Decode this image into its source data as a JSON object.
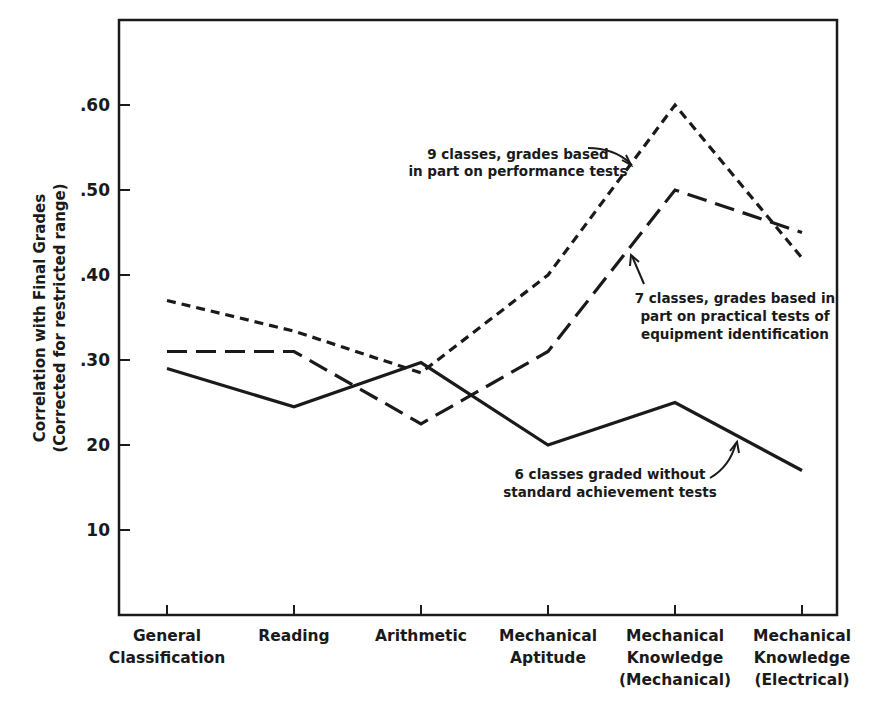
{
  "chart_data": {
    "type": "line",
    "title": "",
    "xlabel": "",
    "ylabel": "Correlation with Final Grades",
    "ylabel_sub": "(Corrected for restricted range)",
    "ylim": [
      0,
      0.7
    ],
    "grid": false,
    "legend_position": "inline annotations",
    "yticks": [
      {
        "value": 0.6,
        "label": ".60"
      },
      {
        "value": 0.5,
        "label": ".50"
      },
      {
        "value": 0.4,
        "label": ".40"
      },
      {
        "value": 0.3,
        "label": ".30"
      },
      {
        "value": 0.2,
        "label": "20"
      },
      {
        "value": 0.1,
        "label": "10"
      }
    ],
    "categories": [
      [
        "General",
        "Classification"
      ],
      [
        "Reading"
      ],
      [
        "Arithmetic"
      ],
      [
        "Mechanical",
        "Aptitude"
      ],
      [
        "Mechanical",
        "Knowledge",
        "(Mechanical)"
      ],
      [
        "Mechanical",
        "Knowledge",
        "(Electrical)"
      ]
    ],
    "series": [
      {
        "name": "9 classes, grades based in part on performance tests",
        "style": "short-dash",
        "values": [
          0.37,
          0.334,
          0.285,
          0.4,
          0.6,
          0.42
        ],
        "annotation": [
          "9 classes, grades based",
          "in part on performance tests"
        ]
      },
      {
        "name": "7 classes, grades based in part on practical tests of equipment identification",
        "style": "long-dash",
        "values": [
          0.31,
          0.31,
          0.225,
          0.31,
          0.5,
          0.45
        ],
        "annotation": [
          "7 classes, grades based in",
          "part on practical tests of",
          "equipment identification"
        ]
      },
      {
        "name": "6 classes graded without standard achievement tests",
        "style": "solid",
        "values": [
          0.29,
          0.245,
          0.297,
          0.2,
          0.25,
          0.17
        ],
        "annotation": [
          "6 classes graded without",
          "standard achievement tests"
        ]
      }
    ]
  },
  "colors": {
    "ink": "#1a1a1a",
    "background": "#ffffff"
  }
}
